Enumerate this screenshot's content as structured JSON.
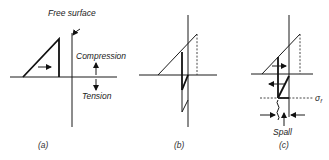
{
  "figure": {
    "panels": [
      {
        "id": "a",
        "caption": "(a)",
        "annotations": {
          "free_surface": "Free surface",
          "compression": "Compression",
          "tension": "Tension"
        }
      },
      {
        "id": "b",
        "caption": "(b)"
      },
      {
        "id": "c",
        "caption": "(c)",
        "annotations": {
          "fracture_stress": "σ",
          "fracture_stress_sub": "f",
          "spall": "Spall"
        }
      }
    ]
  }
}
